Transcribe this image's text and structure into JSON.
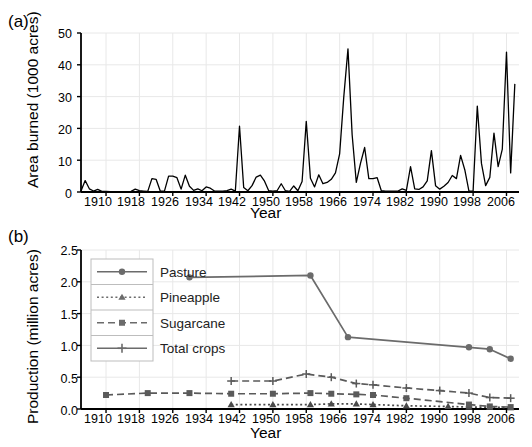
{
  "figure": {
    "panel_a_label": "(a)",
    "panel_b_label": "(b)"
  },
  "chart_data": [
    {
      "type": "line",
      "panel": "(a)",
      "title": "",
      "xlabel": "Year",
      "ylabel": "Area burned (1000 acres)",
      "xlim": [
        1904,
        2009
      ],
      "ylim": [
        0,
        50
      ],
      "grid": true,
      "xticks": [
        1910,
        1918,
        1926,
        1934,
        1942,
        1950,
        1958,
        1966,
        1974,
        1982,
        1990,
        1998,
        2006
      ],
      "yticks": [
        0,
        10,
        20,
        30,
        40,
        50
      ],
      "legend": "none",
      "series": [
        {
          "name": "Area burned",
          "x": [
            1904,
            1905,
            1906,
            1907,
            1908,
            1909,
            1910,
            1911,
            1912,
            1913,
            1914,
            1915,
            1916,
            1917,
            1918,
            1919,
            1920,
            1921,
            1922,
            1923,
            1924,
            1925,
            1926,
            1927,
            1928,
            1929,
            1930,
            1931,
            1932,
            1933,
            1934,
            1935,
            1936,
            1937,
            1938,
            1939,
            1940,
            1941,
            1942,
            1943,
            1944,
            1945,
            1946,
            1947,
            1948,
            1949,
            1950,
            1951,
            1952,
            1953,
            1954,
            1955,
            1956,
            1957,
            1958,
            1959,
            1960,
            1961,
            1962,
            1963,
            1964,
            1965,
            1966,
            1967,
            1968,
            1969,
            1970,
            1971,
            1972,
            1973,
            1974,
            1975,
            1976,
            1977,
            1978,
            1979,
            1980,
            1981,
            1982,
            1983,
            1984,
            1985,
            1986,
            1987,
            1988,
            1989,
            1990,
            1991,
            1992,
            1993,
            1994,
            1995,
            1996,
            1997,
            1998,
            1999,
            2000,
            2001,
            2002,
            2003,
            2004,
            2005,
            2006,
            2007,
            2008
          ],
          "y": [
            0.3,
            3.6,
            1.0,
            0.3,
            0.8,
            0.2,
            0.2,
            0.1,
            0.1,
            0.1,
            0.1,
            0.1,
            0.2,
            0.9,
            0.4,
            0.3,
            0.2,
            4.2,
            4.0,
            0.3,
            0.3,
            5.0,
            5.0,
            4.5,
            0.9,
            5.3,
            1.8,
            0.5,
            1.0,
            0.4,
            1.6,
            1.2,
            0.3,
            0.3,
            0.3,
            0.4,
            0.9,
            0.3,
            20.7,
            1.4,
            0.4,
            2.0,
            4.7,
            5.3,
            3.4,
            0.4,
            0.3,
            0.4,
            2.6,
            0.4,
            0.2,
            1.9,
            0.4,
            3.3,
            22.2,
            4.3,
            1.6,
            5.4,
            2.6,
            3.0,
            4.0,
            6.0,
            12.0,
            30.0,
            45.0,
            18.0,
            3.0,
            9.0,
            14.0,
            4.2,
            4.2,
            4.5,
            0.4,
            0.3,
            0.3,
            0.3,
            0.3,
            1.0,
            0.5,
            8.0,
            1.0,
            0.8,
            1.6,
            3.5,
            13.0,
            2.0,
            0.9,
            1.8,
            3.0,
            5.2,
            4.2,
            11.5,
            7.0,
            0.3,
            0.3,
            27.0,
            9.0,
            2.0,
            4.6,
            18.5,
            8.0,
            13.5,
            44.0,
            6.0,
            34.0
          ]
        }
      ]
    },
    {
      "type": "line",
      "panel": "(b)",
      "title": "",
      "xlabel": "Year",
      "ylabel": "Production (million acres)",
      "xlim": [
        1904,
        2009
      ],
      "ylim": [
        0.0,
        2.5
      ],
      "grid": true,
      "xticks": [
        1910,
        1918,
        1926,
        1934,
        1942,
        1950,
        1958,
        1966,
        1974,
        1982,
        1990,
        1998,
        2006
      ],
      "yticks": [
        "0.0",
        "0.5",
        "1.0",
        "1.5",
        "2.0",
        "2.5"
      ],
      "legend": "upper-left",
      "series": [
        {
          "name": "Pasture",
          "marker": "circle",
          "line": "solid",
          "color": "#6b6b6b",
          "x": [
            1930,
            1959,
            1968,
            1997,
            2002,
            2007
          ],
          "y": [
            2.07,
            2.1,
            1.13,
            0.97,
            0.94,
            0.79
          ]
        },
        {
          "name": "Pineapple",
          "marker": "triangle",
          "line": "dotted",
          "color": "#4a4a4a",
          "x": [
            1940,
            1950,
            1959,
            1964,
            1970,
            1974,
            1982,
            1992,
            1997,
            2002,
            2007
          ],
          "y": [
            0.07,
            0.07,
            0.07,
            0.08,
            0.08,
            0.07,
            0.05,
            0.04,
            0.03,
            0.03,
            0.02
          ]
        },
        {
          "name": "Sugarcane",
          "marker": "square",
          "line": "dashed",
          "color": "#5a5a5a",
          "x": [
            1910,
            1920,
            1930,
            1940,
            1950,
            1959,
            1964,
            1970,
            1974,
            1982,
            1997,
            2002,
            2007
          ],
          "y": [
            0.22,
            0.25,
            0.25,
            0.24,
            0.24,
            0.25,
            0.24,
            0.23,
            0.22,
            0.17,
            0.07,
            0.04,
            0.03
          ]
        },
        {
          "name": "Total crops",
          "marker": "plus",
          "line": "dashed",
          "color": "#5a5a5a",
          "x": [
            1940,
            1950,
            1958,
            1964,
            1970,
            1974,
            1982,
            1990,
            1997,
            2002,
            2007
          ],
          "y": [
            0.44,
            0.44,
            0.55,
            0.5,
            0.4,
            0.38,
            0.33,
            0.29,
            0.25,
            0.18,
            0.17
          ]
        }
      ]
    }
  ],
  "panel_a": {
    "ylabel": "Area burned (1000 acres)",
    "xlabel": "Year",
    "yticks": [
      "0",
      "10",
      "20",
      "30",
      "40",
      "50"
    ],
    "xticks": [
      "1910",
      "1918",
      "1926",
      "1934",
      "1942",
      "1950",
      "1958",
      "1966",
      "1974",
      "1982",
      "1990",
      "1998",
      "2006"
    ]
  },
  "panel_b": {
    "ylabel": "Production (million acres)",
    "xlabel": "Year",
    "yticks": [
      "0.0",
      "0.5",
      "1.0",
      "1.5",
      "2.0",
      "2.5"
    ],
    "xticks": [
      "1910",
      "1918",
      "1926",
      "1934",
      "1942",
      "1950",
      "1958",
      "1966",
      "1974",
      "1982",
      "1990",
      "1998",
      "2006"
    ],
    "legend": {
      "items": [
        {
          "label": "Pasture",
          "marker": "circle",
          "line": "solid"
        },
        {
          "label": "Pineapple",
          "marker": "triangle",
          "line": "dotted"
        },
        {
          "label": "Sugarcane",
          "marker": "square",
          "line": "dashed"
        },
        {
          "label": "Total crops",
          "marker": "plus",
          "line": "solid"
        }
      ]
    }
  },
  "colors": {
    "axis": "#000000",
    "grid": "#e8e8e8",
    "line_a": "#000000",
    "series_gray": "#6b6b6b"
  }
}
